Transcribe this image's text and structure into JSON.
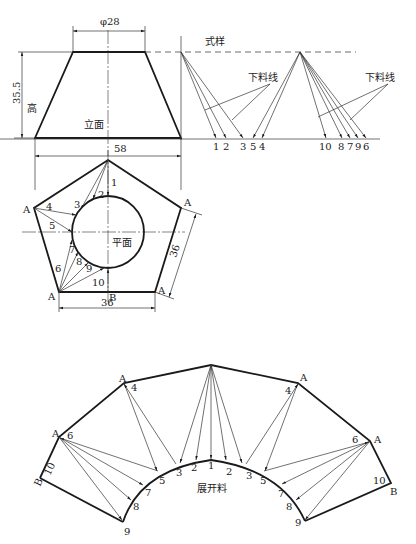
{
  "figure": {
    "elevation": {
      "title": "立面",
      "height_label": "高",
      "top_diameter": "φ28",
      "height_dim": "35.5",
      "bottom_width": "58"
    },
    "template": {
      "title": "式样",
      "cut_line_label_1": "下料线",
      "cut_line_label_2": "下料线",
      "group1_labels": [
        "1",
        "2",
        "3",
        "5",
        "4"
      ],
      "group2_labels": [
        "10",
        "8",
        "7",
        "9",
        "6"
      ]
    },
    "plan": {
      "title": "平面",
      "corner_label": "A",
      "bottom_mid_label": "B",
      "side_dim": "36",
      "bottom_dim": "36",
      "line_labels": [
        "1",
        "2",
        "3",
        "4",
        "5",
        "6",
        "7",
        "8",
        "9",
        "10"
      ]
    },
    "development": {
      "title": "展开料",
      "corner_label": "A",
      "end_label": "B",
      "arc_labels_center": [
        "3",
        "2",
        "1",
        "2",
        "3"
      ],
      "left_labels": [
        "4",
        "6",
        "5",
        "7",
        "8",
        "9",
        "10"
      ],
      "right_labels": [
        "4",
        "6",
        "5",
        "7",
        "8",
        "9",
        "10"
      ]
    }
  },
  "colors": {
    "line": "#1a1a1a",
    "background": "#ffffff"
  }
}
